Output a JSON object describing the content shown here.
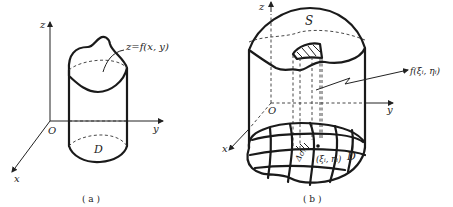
{
  "figure_a": {
    "caption": "( a )",
    "axis_z": "z",
    "axis_y": "y",
    "axis_x": "x",
    "origin": "O",
    "surface_label": "z=f(x, y)",
    "region_label": "D"
  },
  "figure_b": {
    "caption": "( b )",
    "axis_z": "z",
    "axis_y": "y",
    "axis_x": "x",
    "origin": "O",
    "surface_label": "S",
    "value_label": "f(ξᵢ, ηᵢ)",
    "point_label": "(ξᵢ, ηᵢ)",
    "area_element_label": "Δσᵢ",
    "region_label": "D"
  }
}
